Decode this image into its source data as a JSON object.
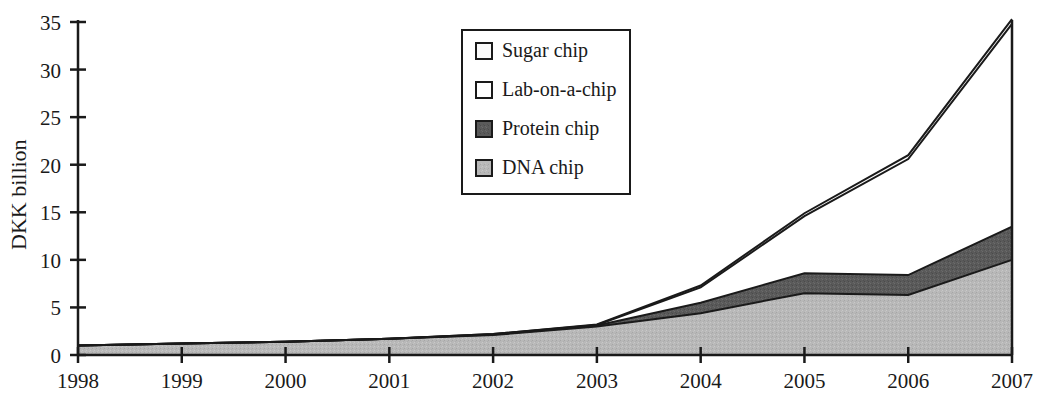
{
  "chart_data": {
    "type": "area",
    "stacked": true,
    "title": "",
    "subtitle": "",
    "xlabel": "",
    "ylabel": "DKK billion",
    "categories": [
      "1998",
      "1999",
      "2000",
      "2001",
      "2002",
      "2003",
      "2004",
      "2005",
      "2006",
      "2007"
    ],
    "x": [
      1998,
      1999,
      2000,
      2001,
      2002,
      2003,
      2004,
      2005,
      2006,
      2007
    ],
    "xlim": [
      1998,
      2007
    ],
    "ylim": [
      0,
      35
    ],
    "yticks": [
      0,
      5,
      10,
      15,
      20,
      25,
      30,
      35
    ],
    "ytick_labels": [
      "0",
      "5",
      "10",
      "15",
      "20",
      "25",
      "30",
      "35"
    ],
    "grid": false,
    "legend_position": "top-center-inside",
    "series": [
      {
        "name": "DNA chip",
        "color": "#b8b8b8",
        "values": [
          1.0,
          1.2,
          1.4,
          1.7,
          2.1,
          3.0,
          4.4,
          6.5,
          6.3,
          10.0
        ]
      },
      {
        "name": "Protein chip",
        "color": "#5a5a5a",
        "values": [
          0.0,
          0.0,
          0.0,
          0.0,
          0.05,
          0.1,
          1.1,
          2.1,
          2.1,
          3.5
        ]
      },
      {
        "name": "Lab-on-a-chip",
        "color": "#ffffff",
        "values": [
          0.0,
          0.0,
          0.0,
          0.0,
          0.05,
          0.05,
          1.6,
          6.0,
          12.2,
          21.3
        ]
      },
      {
        "name": "Sugar chip",
        "color": "#fafafa",
        "values": [
          0.0,
          0.0,
          0.0,
          0.0,
          0.0,
          0.05,
          0.2,
          0.3,
          0.4,
          0.5
        ]
      }
    ],
    "cumulative_tops": {
      "dna_chip": [
        1.0,
        1.2,
        1.4,
        1.7,
        2.1,
        3.0,
        4.4,
        6.5,
        6.3,
        10.0
      ],
      "protein_chip": [
        1.0,
        1.2,
        1.4,
        1.7,
        2.15,
        3.1,
        5.5,
        8.6,
        8.4,
        13.5
      ],
      "lab_on_a_chip": [
        1.0,
        1.2,
        1.4,
        1.7,
        2.2,
        3.15,
        7.1,
        14.6,
        20.6,
        34.8
      ],
      "sugar_chip": [
        1.0,
        1.2,
        1.4,
        1.7,
        2.2,
        3.2,
        7.3,
        14.9,
        21.0,
        35.3
      ]
    },
    "legend_entries": [
      {
        "label": "Sugar chip",
        "swatch": "#fafafa"
      },
      {
        "label": "Lab-on-a-chip",
        "swatch": "#ffffff"
      },
      {
        "label": "Protein chip",
        "swatch": "#5a5a5a"
      },
      {
        "label": "DNA chip",
        "swatch": "#b8b8b8"
      }
    ]
  },
  "axes": {
    "y_axis_title": "DKK billion",
    "y_ticks": [
      "0",
      "5",
      "10",
      "15",
      "20",
      "25",
      "30",
      "35"
    ],
    "x_ticks": [
      "1998",
      "1999",
      "2000",
      "2001",
      "2002",
      "2003",
      "2004",
      "2005",
      "2006",
      "2007"
    ]
  },
  "legend": {
    "items": [
      {
        "label": "Sugar chip"
      },
      {
        "label": "Lab-on-a-chip"
      },
      {
        "label": "Protein chip"
      },
      {
        "label": "DNA chip"
      }
    ]
  },
  "colors": {
    "dna_chip": "#b8b8b8",
    "protein_chip": "#5a5a5a",
    "lab_on_a_chip": "#ffffff",
    "sugar_chip": "#fafafa",
    "axis": "#1a1a1a",
    "text": "#1a1a1a",
    "background": "#ffffff"
  }
}
